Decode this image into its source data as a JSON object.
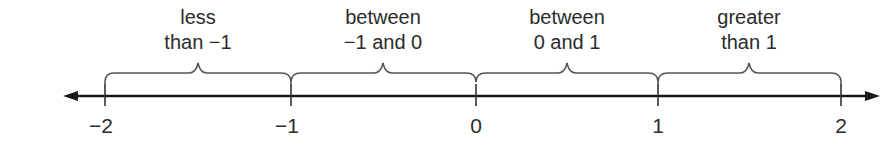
{
  "diagram": {
    "type": "number-line",
    "axis": {
      "min": -2,
      "max": 2,
      "arrows": "both"
    },
    "ticks": [
      {
        "value": -2,
        "label": "−2",
        "x": 105
      },
      {
        "value": -1,
        "label": "−1",
        "x": 291
      },
      {
        "value": 0,
        "label": "0",
        "x": 476
      },
      {
        "value": 1,
        "label": "1",
        "x": 658
      },
      {
        "value": 2,
        "label": "2",
        "x": 841
      }
    ],
    "intervals": [
      {
        "line1": "less",
        "line2": "than −1",
        "from": -2,
        "to": -1
      },
      {
        "line1": "between",
        "line2": "−1 and 0",
        "from": -1,
        "to": 0
      },
      {
        "line1": "between",
        "line2": "0 and 1",
        "from": 0,
        "to": 1
      },
      {
        "line1": "greater",
        "line2": "than 1",
        "from": 1,
        "to": 2
      }
    ],
    "colors": {
      "line": "#1a1a1a",
      "brace": "#555555",
      "text": "#2b2b2b"
    }
  }
}
